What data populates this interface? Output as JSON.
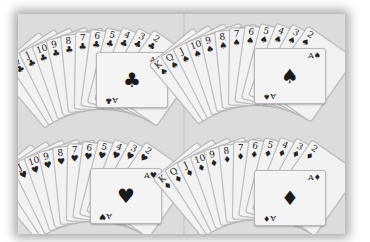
{
  "scene": {
    "description": "Four fans of playing cards, one per suit, arranged in a 2x2 grid on a light gray surface, photo with white border and drop shadow",
    "colors": {
      "background": "#ffffff",
      "surface": "#dcdcdc",
      "card": "#f2f2f2",
      "ink": "#1a1a1a"
    }
  },
  "fans": [
    {
      "position": "top-left",
      "suit": "clubs",
      "symbol": "♣",
      "ranks": [
        "K",
        "Q",
        "J",
        "10",
        "9",
        "8",
        "7",
        "6",
        "5",
        "4",
        "3",
        "2"
      ],
      "front_card": "A"
    },
    {
      "position": "top-right",
      "suit": "spades",
      "symbol": "♠",
      "ranks": [
        "K",
        "Q",
        "J",
        "10",
        "9",
        "8",
        "7",
        "6",
        "5",
        "4",
        "3",
        "2"
      ],
      "front_card": "A"
    },
    {
      "position": "bottom-left",
      "suit": "hearts",
      "symbol": "♥",
      "ranks": [
        "K",
        "Q",
        "J",
        "10",
        "9",
        "8",
        "7",
        "6",
        "5",
        "4",
        "3",
        "2"
      ],
      "front_card": "A"
    },
    {
      "position": "bottom-right",
      "suit": "diamonds",
      "symbol": "♦",
      "ranks": [
        "K",
        "Q",
        "J",
        "10",
        "9",
        "8",
        "7",
        "6",
        "5",
        "4",
        "3",
        "2"
      ],
      "front_card": "A"
    }
  ]
}
